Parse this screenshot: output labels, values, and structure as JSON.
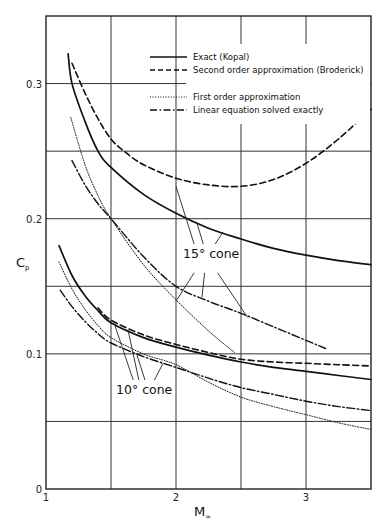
{
  "chart_data": {
    "type": "line",
    "title": "",
    "xlabel": "M",
    "xlabel_subscript": "∞",
    "ylabel": "C",
    "ylabel_subscript": "p",
    "xlim": [
      1,
      3.5
    ],
    "ylim": [
      0,
      0.35
    ],
    "grid": true,
    "x_gridlines": [
      1.5,
      2,
      2.5,
      3
    ],
    "y_gridlines": [
      0.05,
      0.1,
      0.15,
      0.2,
      0.25,
      0.3
    ],
    "x_ticks": [
      {
        "value": 1,
        "label": "1"
      },
      {
        "value": 2,
        "label": "2"
      },
      {
        "value": 3,
        "label": "3"
      }
    ],
    "y_ticks": [
      {
        "value": 0,
        "label": "0"
      },
      {
        "value": 0.1,
        "label": "0.1"
      },
      {
        "value": 0.2,
        "label": "0.2"
      },
      {
        "value": 0.3,
        "label": "0.3"
      }
    ],
    "legend_position": "top-right",
    "legend": [
      {
        "label": "Exact (Kopal)",
        "style": "solid"
      },
      {
        "label": "Second order approximation (Broderick)",
        "style": "dashed"
      },
      {
        "label": "First order approximation",
        "style": "dotted"
      },
      {
        "label": "Linear equation solved exactly",
        "style": "dashdot"
      }
    ],
    "annotations": [
      {
        "text": "15° cone",
        "x": 2.28,
        "y": 0.173
      },
      {
        "text": "10° cone",
        "x": 1.7,
        "y": 0.073
      }
    ],
    "series": [
      {
        "name": "Exact (Kopal) – 15° cone",
        "style": "solid",
        "cone": "15°",
        "x": [
          1.17,
          1.2,
          1.3,
          1.4,
          1.5,
          1.75,
          2.0,
          2.25,
          2.5,
          2.75,
          3.0,
          3.25,
          3.5
        ],
        "y": [
          0.322,
          0.3,
          0.272,
          0.25,
          0.238,
          0.218,
          0.204,
          0.193,
          0.185,
          0.178,
          0.173,
          0.169,
          0.166
        ]
      },
      {
        "name": "Second order approximation (Broderick) – 15° cone",
        "style": "dashed",
        "cone": "15°",
        "x": [
          1.2,
          1.3,
          1.4,
          1.5,
          1.6,
          1.75,
          2.0,
          2.25,
          2.5,
          2.75,
          3.0,
          3.25,
          3.5
        ],
        "y": [
          0.315,
          0.293,
          0.274,
          0.259,
          0.25,
          0.24,
          0.23,
          0.225,
          0.224,
          0.229,
          0.241,
          0.259,
          0.281
        ]
      },
      {
        "name": "First order approximation – 15° cone",
        "style": "dotted",
        "cone": "15°",
        "x": [
          1.19,
          1.3,
          1.4,
          1.5,
          1.75,
          2.0,
          2.25,
          2.45
        ],
        "y": [
          0.275,
          0.24,
          0.217,
          0.2,
          0.166,
          0.14,
          0.117,
          0.101
        ]
      },
      {
        "name": "Linear equation solved exactly – 15° cone",
        "style": "dashdot",
        "cone": "15°",
        "x": [
          1.2,
          1.3,
          1.4,
          1.5,
          1.75,
          2.0,
          2.25,
          2.5,
          2.75,
          3.0,
          3.15
        ],
        "y": [
          0.243,
          0.225,
          0.211,
          0.2,
          0.172,
          0.15,
          0.139,
          0.13,
          0.12,
          0.11,
          0.104
        ]
      },
      {
        "name": "Exact (Kopal) – 10° cone",
        "style": "solid",
        "cone": "10°",
        "x": [
          1.1,
          1.2,
          1.3,
          1.4,
          1.5,
          1.75,
          2.0,
          2.25,
          2.5,
          2.75,
          3.0,
          3.25,
          3.5
        ],
        "y": [
          0.18,
          0.158,
          0.143,
          0.132,
          0.123,
          0.112,
          0.105,
          0.099,
          0.094,
          0.09,
          0.087,
          0.084,
          0.081
        ]
      },
      {
        "name": "Second order approximation (Broderick) – 10° cone",
        "style": "dashed",
        "cone": "10°",
        "x": [
          1.4,
          1.5,
          1.75,
          2.0,
          2.25,
          2.5,
          2.75,
          3.0,
          3.25,
          3.5
        ],
        "y": [
          0.134,
          0.125,
          0.114,
          0.107,
          0.101,
          0.096,
          0.094,
          0.093,
          0.092,
          0.091
        ]
      },
      {
        "name": "First order approximation – 10° cone",
        "style": "dotted",
        "cone": "10°",
        "x": [
          1.1,
          1.2,
          1.3,
          1.4,
          1.5,
          1.75,
          2.0,
          2.25,
          2.5,
          2.75,
          3.0,
          3.25,
          3.5
        ],
        "y": [
          0.168,
          0.148,
          0.133,
          0.121,
          0.112,
          0.1,
          0.092,
          0.079,
          0.068,
          0.061,
          0.055,
          0.049,
          0.044
        ]
      },
      {
        "name": "Linear equation solved exactly – 10° cone",
        "style": "dashdot",
        "cone": "10°",
        "x": [
          1.11,
          1.2,
          1.3,
          1.4,
          1.5,
          1.75,
          2.0,
          2.25,
          2.5,
          2.75,
          3.0,
          3.25,
          3.5
        ],
        "y": [
          0.147,
          0.135,
          0.124,
          0.115,
          0.108,
          0.098,
          0.09,
          0.082,
          0.075,
          0.07,
          0.065,
          0.061,
          0.058
        ]
      }
    ]
  }
}
